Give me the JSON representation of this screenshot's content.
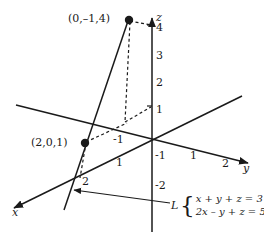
{
  "figure": {
    "type": "3d-coordinate-diagram",
    "stroke_color": "#1a1a1a",
    "background_color": "#ffffff"
  },
  "axes": {
    "x": {
      "label": "x",
      "ticks": [
        "1",
        "2"
      ]
    },
    "y": {
      "label": "y",
      "ticks": [
        "-1",
        "1",
        "2"
      ]
    },
    "z": {
      "label": "z",
      "ticks": [
        "4",
        "3",
        "2",
        "1",
        "-1",
        "-2"
      ]
    }
  },
  "points": [
    {
      "id": "p1",
      "label": "(0,–1,4)",
      "coords": [
        0,
        -1,
        4
      ]
    },
    {
      "id": "p2",
      "label": "(2,0,1)",
      "coords": [
        2,
        0,
        1
      ]
    }
  ],
  "line": {
    "name_label": "L",
    "equations": [
      "x + y + z = 3",
      "2x – y + z = 5"
    ],
    "brace": "{"
  },
  "tick_labels": {
    "z4": "4",
    "z3": "3",
    "z2": "2",
    "z1": "1",
    "zn1": "-1",
    "zn2": "-2",
    "yn1": "-1",
    "y1": "1",
    "y2": "2",
    "x1": "1",
    "x2": "2"
  }
}
